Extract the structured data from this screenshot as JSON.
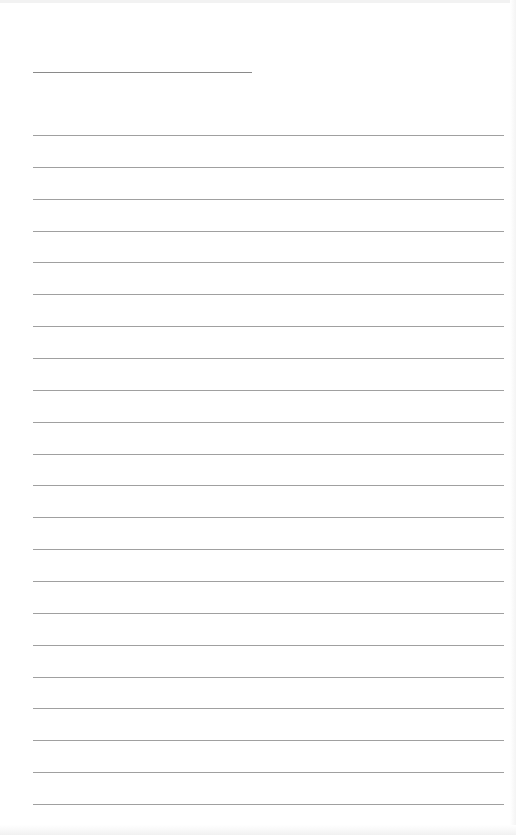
{
  "page": {
    "type": "blank lined writing sheet",
    "background_color": "#ffffff",
    "line_color": "#a0a0a0"
  },
  "header_field": {
    "label": "",
    "value": ""
  },
  "lines": {
    "count": 22,
    "first_y": 135,
    "spacing": 31.86,
    "values": [
      "",
      "",
      "",
      "",
      "",
      "",
      "",
      "",
      "",
      "",
      "",
      "",
      "",
      "",
      "",
      "",
      "",
      "",
      "",
      "",
      "",
      ""
    ]
  }
}
